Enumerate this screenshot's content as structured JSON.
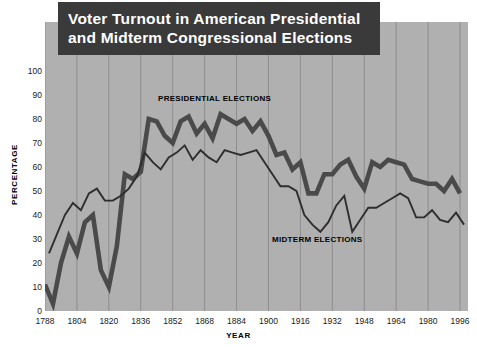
{
  "title": {
    "line1": "Voter Turnout in American Presidential",
    "line2": "and Midterm Congressional Elections"
  },
  "axes": {
    "ylabel": "PERCENTAGE",
    "xlabel": "YEAR",
    "yticks": [
      "0",
      "10",
      "20",
      "30",
      "40",
      "50",
      "60",
      "70",
      "80",
      "90",
      "100"
    ],
    "xticks": [
      "1788",
      "1804",
      "1820",
      "1836",
      "1852",
      "1868",
      "1884",
      "1900",
      "1916",
      "1932",
      "1948",
      "1964",
      "1980",
      "1996"
    ]
  },
  "annotations": {
    "presidential": "PRESIDENTIAL ELECTIONS",
    "midterm": "MIDTERM ELECTIONS"
  },
  "colors": {
    "title_box": "#3a3a3a",
    "title_text": "#ffffff",
    "plot_background": "#b0b0b0",
    "gridline": "#8e8e8e",
    "presidential_line": "#4a4a4a",
    "midterm_line": "#2e2e2e",
    "page_background": "#ffffff"
  },
  "chart_data": {
    "type": "line",
    "title": "Voter Turnout in American Presidential and Midterm Congressional Elections",
    "xlabel": "YEAR",
    "ylabel": "PERCENTAGE",
    "xlim": [
      1788,
      2000
    ],
    "ylim": [
      0,
      100
    ],
    "grid": "vertical",
    "legend": "inline-annotations",
    "series": [
      {
        "name": "PRESIDENTIAL ELECTIONS",
        "style": "thick",
        "color": "#4a4a4a",
        "points": [
          [
            1788,
            11
          ],
          [
            1792,
            3
          ],
          [
            1796,
            20
          ],
          [
            1800,
            31
          ],
          [
            1804,
            24
          ],
          [
            1808,
            37
          ],
          [
            1812,
            40
          ],
          [
            1816,
            17
          ],
          [
            1820,
            10
          ],
          [
            1824,
            27
          ],
          [
            1828,
            57
          ],
          [
            1832,
            55
          ],
          [
            1836,
            58
          ],
          [
            1840,
            80
          ],
          [
            1844,
            79
          ],
          [
            1848,
            73
          ],
          [
            1852,
            70
          ],
          [
            1856,
            79
          ],
          [
            1860,
            81
          ],
          [
            1864,
            74
          ],
          [
            1868,
            78
          ],
          [
            1872,
            72
          ],
          [
            1876,
            82
          ],
          [
            1880,
            80
          ],
          [
            1884,
            78
          ],
          [
            1888,
            80
          ],
          [
            1892,
            75
          ],
          [
            1896,
            79
          ],
          [
            1900,
            73
          ],
          [
            1904,
            65
          ],
          [
            1908,
            66
          ],
          [
            1912,
            59
          ],
          [
            1916,
            62
          ],
          [
            1920,
            49
          ],
          [
            1924,
            49
          ],
          [
            1928,
            57
          ],
          [
            1932,
            57
          ],
          [
            1936,
            61
          ],
          [
            1940,
            63
          ],
          [
            1944,
            56
          ],
          [
            1948,
            51
          ],
          [
            1952,
            62
          ],
          [
            1956,
            60
          ],
          [
            1960,
            63
          ],
          [
            1964,
            62
          ],
          [
            1968,
            61
          ],
          [
            1972,
            55
          ],
          [
            1976,
            54
          ],
          [
            1980,
            53
          ],
          [
            1984,
            53
          ],
          [
            1988,
            50
          ],
          [
            1992,
            55
          ],
          [
            1996,
            49
          ]
        ]
      },
      {
        "name": "MIDTERM ELECTIONS",
        "style": "thin",
        "color": "#2e2e2e",
        "points": [
          [
            1790,
            24
          ],
          [
            1794,
            32
          ],
          [
            1798,
            40
          ],
          [
            1802,
            45
          ],
          [
            1806,
            42
          ],
          [
            1810,
            49
          ],
          [
            1814,
            51
          ],
          [
            1818,
            46
          ],
          [
            1822,
            46
          ],
          [
            1826,
            48
          ],
          [
            1830,
            51
          ],
          [
            1834,
            56
          ],
          [
            1838,
            66
          ],
          [
            1842,
            62
          ],
          [
            1846,
            59
          ],
          [
            1850,
            64
          ],
          [
            1854,
            66
          ],
          [
            1858,
            69
          ],
          [
            1862,
            63
          ],
          [
            1866,
            67
          ],
          [
            1870,
            64
          ],
          [
            1874,
            62
          ],
          [
            1878,
            67
          ],
          [
            1882,
            66
          ],
          [
            1886,
            65
          ],
          [
            1890,
            66
          ],
          [
            1894,
            67
          ],
          [
            1898,
            62
          ],
          [
            1902,
            57
          ],
          [
            1906,
            52
          ],
          [
            1910,
            52
          ],
          [
            1914,
            50
          ],
          [
            1918,
            40
          ],
          [
            1922,
            36
          ],
          [
            1926,
            33
          ],
          [
            1930,
            37
          ],
          [
            1934,
            44
          ],
          [
            1938,
            48
          ],
          [
            1942,
            33
          ],
          [
            1946,
            38
          ],
          [
            1950,
            43
          ],
          [
            1954,
            43
          ],
          [
            1958,
            45
          ],
          [
            1962,
            47
          ],
          [
            1966,
            49
          ],
          [
            1970,
            47
          ],
          [
            1974,
            39
          ],
          [
            1978,
            39
          ],
          [
            1982,
            42
          ],
          [
            1986,
            38
          ],
          [
            1990,
            37
          ],
          [
            1994,
            41
          ],
          [
            1998,
            36
          ]
        ]
      }
    ]
  }
}
